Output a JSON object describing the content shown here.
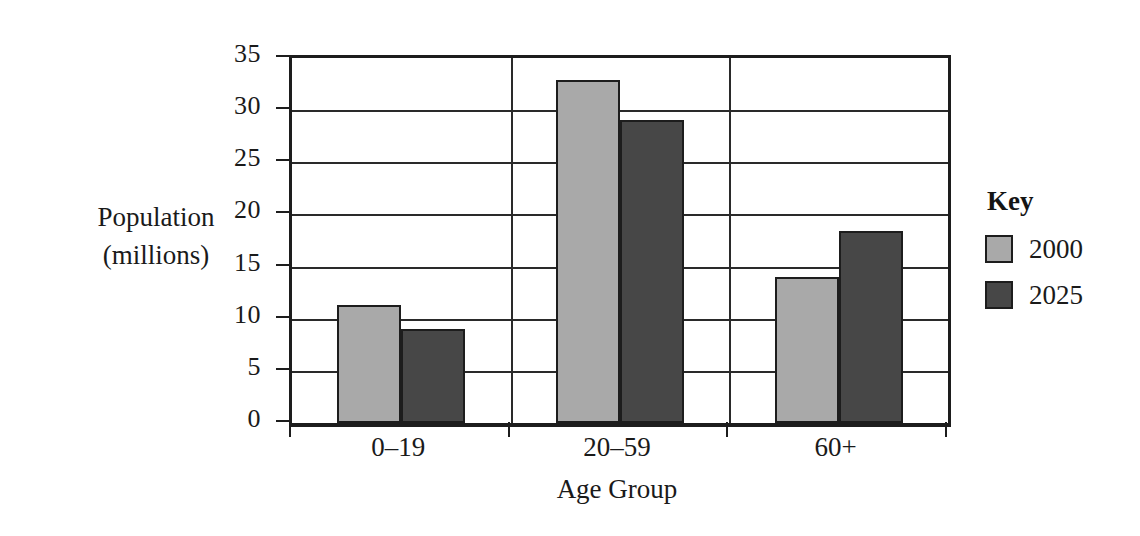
{
  "chart_data": {
    "type": "bar",
    "title": "",
    "xlabel": "Age Group",
    "ylabel": "Population\n(millions)",
    "ylabel_lines": [
      "Population",
      "(millions)"
    ],
    "categories": [
      "0–19",
      "20–59",
      "60+"
    ],
    "series": [
      {
        "name": "2000",
        "color": "#a9a9a9",
        "values": [
          11.3,
          32.9,
          14.0
        ]
      },
      {
        "name": "2025",
        "color": "#474747",
        "values": [
          9.0,
          29.1,
          18.4
        ]
      }
    ],
    "ylim": [
      0,
      35
    ],
    "ytick_labels": [
      "0",
      "5",
      "10",
      "15",
      "20",
      "25",
      "30",
      "35"
    ],
    "ytick_values": [
      0,
      5,
      10,
      15,
      20,
      25,
      30,
      35
    ],
    "grid": true,
    "grid_axis": "y",
    "legend_title": "Key",
    "legend_position": "right",
    "legend_entries": [
      {
        "label": "2000",
        "color": "#a9a9a9"
      },
      {
        "label": "2025",
        "color": "#474747"
      }
    ],
    "background_color": "#ffffff",
    "axis_color": "#1d1d1d"
  }
}
